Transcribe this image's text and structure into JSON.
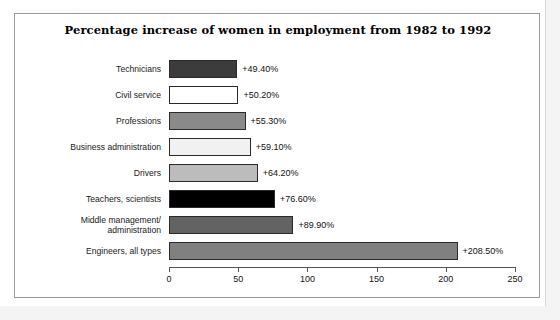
{
  "chart_data": {
    "type": "bar",
    "orientation": "horizontal",
    "title": "Percentage increase of women in employment from 1982 to 1992",
    "xlabel": "",
    "ylabel": "",
    "xlim": [
      0,
      250
    ],
    "xticks": [
      "0",
      "50",
      "100",
      "150",
      "200",
      "250"
    ],
    "grid": false,
    "legend": false,
    "categories": [
      "Technicians",
      "Civil service",
      "Professions",
      "Business administration",
      "Drivers",
      "Teachers, scientists",
      "Middle management/\nadministration",
      "Engineers, all types"
    ],
    "values": [
      49.4,
      50.2,
      55.3,
      59.1,
      64.2,
      76.6,
      89.9,
      208.5
    ],
    "data_labels": [
      "+49.40%",
      "+50.20%",
      "+55.30%",
      "+59.10%",
      "+64.20%",
      "+76.60%",
      "+89.90%",
      "+208.50%"
    ],
    "bar_colors": [
      "#3c3c3c",
      "#ffffff",
      "#8a8a8a",
      "#f1f1f1",
      "#bcbcbc",
      "#000000",
      "#636363",
      "#808080"
    ],
    "bar_border_color": "#2a2a2a",
    "frame_color": "#9a9a9a",
    "axis_color": "#555555",
    "background": "#ffffff"
  }
}
